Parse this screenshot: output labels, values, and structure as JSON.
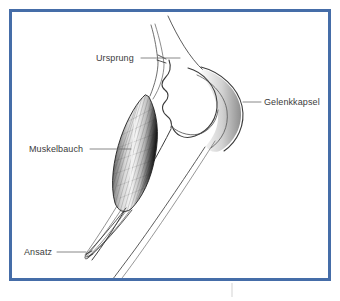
{
  "figure": {
    "language": "de",
    "frame_color": "#456da8",
    "background_color": "#ffffff",
    "ink_color": "#3b3b3b",
    "drawing_style": "pen-and-ink anatomical line drawing"
  },
  "labels": [
    {
      "id": "ursprung",
      "text": "Ursprung",
      "meaning": "origin of the muscle",
      "text_x": 96,
      "text_y": 54,
      "leader_from_x": 141,
      "leader_from_y": 58,
      "leader_to_x": 180,
      "leader_to_y": 58
    },
    {
      "id": "muskelbauch",
      "text": "Muskelbauch",
      "meaning": "muscle belly",
      "text_x": 29,
      "text_y": 145,
      "leader_from_x": 90,
      "leader_from_y": 149,
      "leader_to_x": 131,
      "leader_to_y": 149
    },
    {
      "id": "gelenkkapsel",
      "text": "Gelenkkapsel",
      "meaning": "joint capsule",
      "text_x": 264,
      "text_y": 98,
      "leader_from_x": 243,
      "leader_from_y": 102,
      "leader_to_x": 261,
      "leader_to_y": 102
    },
    {
      "id": "ansatz",
      "text": "Ansatz",
      "meaning": "insertion of the muscle",
      "text_x": 24,
      "text_y": 248,
      "leader_from_x": 57,
      "leader_from_y": 252,
      "leader_to_x": 86,
      "leader_to_y": 252
    }
  ],
  "structures": [
    {
      "id": "muscle-belly",
      "name": "fusiform muscle belly, hatched shading"
    },
    {
      "id": "upper-tendon",
      "name": "proximal tendon running to origin"
    },
    {
      "id": "lower-tendon",
      "name": "distal tendon tapering to insertion"
    },
    {
      "id": "bone-shaft",
      "name": "long bone shaft, two outline strokes"
    },
    {
      "id": "joint-head",
      "name": "rounded articular head of the bone"
    },
    {
      "id": "joint-capsule",
      "name": "capsule outline enveloping the joint head"
    }
  ],
  "icons": {
    "leader_line": "leader-line"
  }
}
